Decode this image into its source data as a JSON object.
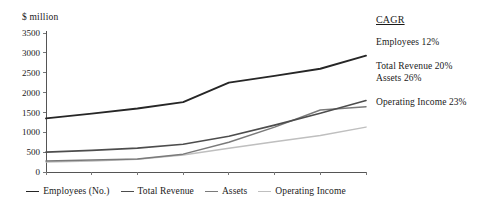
{
  "chart_data": {
    "type": "line",
    "title": "",
    "xlabel": "",
    "ylabel": "$ million",
    "x": [
      1998,
      1999,
      2000,
      2001,
      2002,
      2003,
      2004,
      2005
    ],
    "xticklabels": [
      "1998",
      "1999",
      "2000",
      "2001",
      "2002",
      "2003",
      "2004",
      "2005"
    ],
    "yticklabels": [
      "0",
      "500",
      "1000",
      "1500",
      "2000",
      "2500",
      "3000",
      "3500"
    ],
    "ylim": [
      0,
      3500
    ],
    "ytick_step": 500,
    "grid": false,
    "legend_position": "bottom-center",
    "series": [
      {
        "name": "Employees (No.)",
        "color": "#262626",
        "width": 1.9,
        "values": [
          1350,
          1470,
          1600,
          1760,
          2250,
          2420,
          2600,
          2930
        ]
      },
      {
        "name": "Total Revenue",
        "color": "#4d4d4d",
        "width": 1.6,
        "values": [
          500,
          545,
          600,
          700,
          900,
          1180,
          1480,
          1800
        ]
      },
      {
        "name": "Assets",
        "color": "#7a7a7a",
        "width": 1.5,
        "values": [
          280,
          300,
          330,
          450,
          750,
          1130,
          1560,
          1640
        ]
      },
      {
        "name": "Operating Income",
        "color": "#bfbfbf",
        "width": 1.5,
        "values": [
          250,
          275,
          320,
          430,
          600,
          760,
          920,
          1130
        ]
      }
    ]
  },
  "axis_title": "$ million",
  "cagr": {
    "heading": "CAGR",
    "entries": [
      "Employees 12%",
      "Total Revenue 20%",
      "Assets 26%",
      "Operating Income 23%"
    ]
  }
}
